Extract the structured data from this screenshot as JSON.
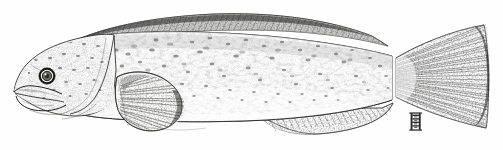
{
  "figure": {
    "kind": "scientific-illustration",
    "common_name_depicted": "wrymouth / wolf-eel type blennioid fish",
    "orientation": "left-facing lateral profile",
    "medium": "pen-and-ink stipple drawing",
    "background_color": "#fefefe",
    "ink_color": "#1a1a1a",
    "body_tone": "#f2f2f0",
    "shadow_tone": "#9a9a98",
    "canvas": {
      "width": 503,
      "height": 150
    }
  },
  "anatomy": {
    "head": {
      "label": "head",
      "snout_tip_x": 14,
      "extent_x": [
        14,
        112
      ]
    },
    "eye": {
      "label": "eye",
      "center_x": 47,
      "center_y": 76,
      "outer_radius": 7.5,
      "iris_radius": 4.6,
      "pupil_radius": 2.2,
      "ring_color": "#111111",
      "iris_color": "#5a5a58",
      "highlight_color": "#ffffff"
    },
    "mouth": {
      "label": "mouth",
      "state": "open",
      "upper_lip_y": 90,
      "lower_jaw_y": 104,
      "extent_x": [
        15,
        62
      ]
    },
    "operculum": {
      "label": "gill-cover",
      "trailing_edge_x": 112
    },
    "dorsal_fin": {
      "label": "dorsal-fin",
      "type": "long continuous",
      "extent_x": [
        62,
        388
      ],
      "peak_y": 14,
      "ray_count": 96,
      "margin_tone": "#3a3a38"
    },
    "anal_fin": {
      "label": "anal-fin",
      "type": "long",
      "extent_x": [
        258,
        392
      ],
      "base_y": 116,
      "ray_count": 44,
      "hatch_angle_deg": 38
    },
    "pectoral_fin": {
      "label": "pectoral-fin",
      "shape": "rounded fan",
      "origin_x": 116,
      "origin_y": 96,
      "extent_x": [
        116,
        186
      ],
      "extent_y": [
        72,
        128
      ],
      "ray_count": 20
    },
    "caudal_peduncle": {
      "label": "caudal-peduncle",
      "x": 392,
      "depth_top_y": 52,
      "depth_bottom_y": 104
    },
    "caudal_fin": {
      "label": "caudal-fin",
      "shape": "rounded fan / truncate",
      "extent_x": [
        396,
        492
      ],
      "extent_y": [
        24,
        128
      ],
      "ray_count": 34
    },
    "lateral_line": {
      "label": "lateral-line",
      "visible": false
    }
  },
  "pattern": {
    "label": "body-mottling",
    "description": "dense fine stipple with irregular darker blotches across flank",
    "blotch_count": 420,
    "stipple_density": "high",
    "darkest_region": "dorsal margin"
  },
  "signature": {
    "label": "artist-monogram",
    "text": "H",
    "x": 414,
    "y": 123,
    "width": 12,
    "height": 17,
    "color": "#2b2b2b"
  },
  "scale_bar": {
    "present": false
  },
  "caption": {
    "present": false,
    "text": ""
  }
}
